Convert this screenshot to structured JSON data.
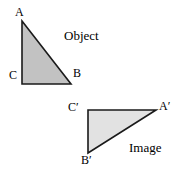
{
  "figure": {
    "background_color": "#ffffff",
    "stroke_color": "#1a1a1a",
    "object_fill_color": "#c2c2c2",
    "image_fill_color": "#e2e2e2",
    "captions": {
      "object": "Object",
      "image": "Image"
    },
    "object_triangle": {
      "name": "ABC",
      "fill": "#c2c2c2",
      "stroke": "#1a1a1a",
      "stroke_width": 1.6,
      "vertices": [
        {
          "label": "A",
          "x": 22,
          "y": 21
        },
        {
          "label": "B",
          "x": 71,
          "y": 84
        },
        {
          "label": "C",
          "x": 22,
          "y": 84
        }
      ]
    },
    "image_triangle": {
      "name": "A'B'C'",
      "fill": "#e2e2e2",
      "stroke": "#1a1a1a",
      "stroke_width": 1.6,
      "vertices": [
        {
          "label": "A′",
          "x": 156,
          "y": 110
        },
        {
          "label": "B′",
          "x": 88,
          "y": 153
        },
        {
          "label": "C′",
          "x": 88,
          "y": 110
        }
      ]
    },
    "labels": {
      "A": "A",
      "B": "B",
      "C": "C",
      "A_prime": "A′",
      "B_prime": "B′",
      "C_prime": "C′"
    }
  }
}
